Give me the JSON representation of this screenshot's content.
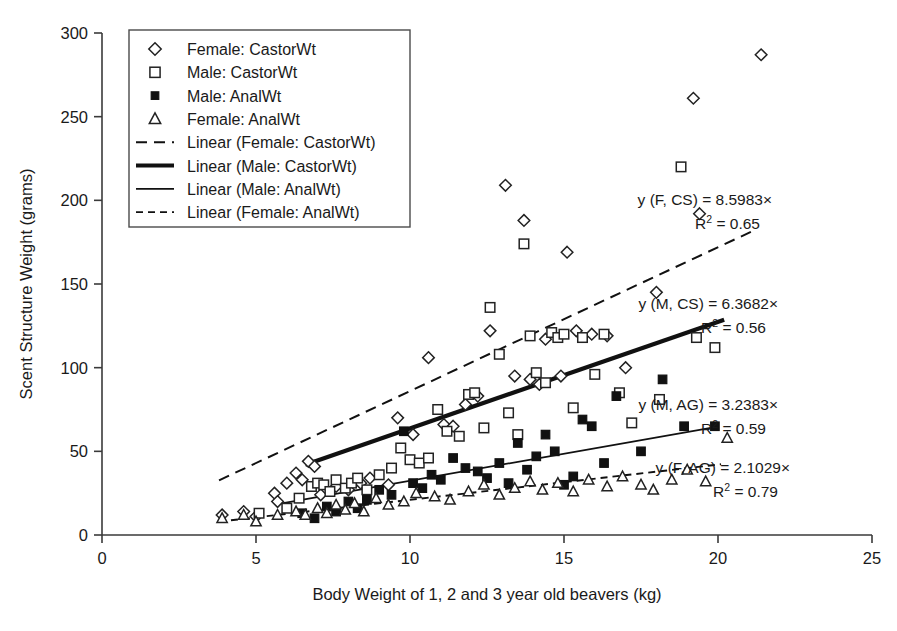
{
  "chart_data": {
    "type": "scatter",
    "title": "",
    "xlabel": "Body Weight of 1, 2 and 3 year old beavers (kg)",
    "ylabel": "Scent Structure Weight (grams)",
    "xlim": [
      0,
      25
    ],
    "ylim": [
      0,
      300
    ],
    "xticks": [
      0,
      5,
      10,
      15,
      20,
      25
    ],
    "yticks": [
      0,
      50,
      100,
      150,
      200,
      250,
      300
    ],
    "grid": false,
    "legend_position": "upper-left",
    "series": [
      {
        "name": "Female: CastorWt",
        "marker": "diamond-open",
        "points": [
          [
            3.9,
            12
          ],
          [
            4.6,
            14
          ],
          [
            5.0,
            11
          ],
          [
            5.6,
            25
          ],
          [
            5.7,
            20
          ],
          [
            6.0,
            31
          ],
          [
            6.3,
            37
          ],
          [
            6.5,
            33
          ],
          [
            6.7,
            44
          ],
          [
            6.9,
            41
          ],
          [
            7.1,
            24
          ],
          [
            7.6,
            29
          ],
          [
            8.0,
            27
          ],
          [
            8.4,
            31
          ],
          [
            8.7,
            34
          ],
          [
            9.3,
            30
          ],
          [
            9.6,
            70
          ],
          [
            10.1,
            60
          ],
          [
            10.6,
            106
          ],
          [
            11.1,
            66
          ],
          [
            11.4,
            65
          ],
          [
            11.8,
            78
          ],
          [
            12.2,
            83
          ],
          [
            12.6,
            122
          ],
          [
            13.1,
            209
          ],
          [
            13.4,
            95
          ],
          [
            13.7,
            188
          ],
          [
            13.9,
            93
          ],
          [
            14.2,
            90
          ],
          [
            14.4,
            117
          ],
          [
            14.9,
            95
          ],
          [
            15.1,
            169
          ],
          [
            15.4,
            122
          ],
          [
            15.9,
            120
          ],
          [
            16.4,
            119
          ],
          [
            17.0,
            100
          ],
          [
            18.0,
            145
          ],
          [
            19.2,
            261
          ],
          [
            19.4,
            192
          ],
          [
            21.4,
            287
          ]
        ]
      },
      {
        "name": "Male: CastorWt",
        "marker": "square-open",
        "points": [
          [
            5.1,
            13
          ],
          [
            6.0,
            16
          ],
          [
            6.4,
            22
          ],
          [
            6.8,
            29
          ],
          [
            7.0,
            31
          ],
          [
            7.2,
            30
          ],
          [
            7.4,
            26
          ],
          [
            7.6,
            33
          ],
          [
            7.9,
            28
          ],
          [
            8.1,
            31
          ],
          [
            8.3,
            34
          ],
          [
            8.6,
            27
          ],
          [
            9.0,
            36
          ],
          [
            9.4,
            40
          ],
          [
            9.7,
            52
          ],
          [
            10.0,
            45
          ],
          [
            10.3,
            43
          ],
          [
            10.6,
            46
          ],
          [
            10.9,
            75
          ],
          [
            11.2,
            62
          ],
          [
            11.6,
            59
          ],
          [
            11.9,
            84
          ],
          [
            12.1,
            85
          ],
          [
            12.4,
            64
          ],
          [
            12.6,
            136
          ],
          [
            12.9,
            108
          ],
          [
            13.2,
            73
          ],
          [
            13.5,
            60
          ],
          [
            13.7,
            174
          ],
          [
            13.9,
            119
          ],
          [
            14.1,
            97
          ],
          [
            14.4,
            91
          ],
          [
            14.6,
            121
          ],
          [
            14.8,
            118
          ],
          [
            15.0,
            120
          ],
          [
            15.3,
            76
          ],
          [
            15.6,
            118
          ],
          [
            16.0,
            96
          ],
          [
            16.3,
            120
          ],
          [
            16.8,
            85
          ],
          [
            17.2,
            67
          ],
          [
            18.1,
            81
          ],
          [
            18.8,
            220
          ],
          [
            19.3,
            118
          ],
          [
            19.9,
            112
          ]
        ]
      },
      {
        "name": "Male: AnalWt",
        "marker": "square-filled",
        "points": [
          [
            6.5,
            13
          ],
          [
            6.9,
            10
          ],
          [
            7.3,
            17
          ],
          [
            7.6,
            14
          ],
          [
            8.0,
            20
          ],
          [
            8.3,
            16
          ],
          [
            8.6,
            21
          ],
          [
            9.0,
            27
          ],
          [
            9.4,
            24
          ],
          [
            9.8,
            62
          ],
          [
            10.1,
            31
          ],
          [
            10.4,
            28
          ],
          [
            10.7,
            36
          ],
          [
            11.0,
            33
          ],
          [
            11.4,
            46
          ],
          [
            11.8,
            40
          ],
          [
            12.2,
            38
          ],
          [
            12.5,
            34
          ],
          [
            12.9,
            43
          ],
          [
            13.2,
            31
          ],
          [
            13.5,
            55
          ],
          [
            13.8,
            39
          ],
          [
            14.1,
            47
          ],
          [
            14.4,
            60
          ],
          [
            14.7,
            50
          ],
          [
            15.0,
            30
          ],
          [
            15.3,
            35
          ],
          [
            15.6,
            69
          ],
          [
            15.9,
            65
          ],
          [
            16.3,
            43
          ],
          [
            16.7,
            83
          ],
          [
            17.5,
            50
          ],
          [
            18.2,
            93
          ],
          [
            18.9,
            65
          ],
          [
            19.9,
            65
          ]
        ]
      },
      {
        "name": "Female: AnalWt",
        "marker": "triangle-open",
        "points": [
          [
            3.9,
            10
          ],
          [
            4.6,
            12
          ],
          [
            5.0,
            8
          ],
          [
            5.7,
            12
          ],
          [
            6.3,
            14
          ],
          [
            6.6,
            12
          ],
          [
            7.0,
            16
          ],
          [
            7.3,
            13
          ],
          [
            7.6,
            18
          ],
          [
            7.9,
            15
          ],
          [
            8.2,
            19
          ],
          [
            8.5,
            14
          ],
          [
            8.9,
            22
          ],
          [
            9.3,
            18
          ],
          [
            9.8,
            20
          ],
          [
            10.2,
            25
          ],
          [
            10.8,
            23
          ],
          [
            11.3,
            21
          ],
          [
            11.9,
            26
          ],
          [
            12.4,
            30
          ],
          [
            12.9,
            24
          ],
          [
            13.4,
            28
          ],
          [
            13.9,
            32
          ],
          [
            14.3,
            27
          ],
          [
            14.8,
            31
          ],
          [
            15.3,
            26
          ],
          [
            15.8,
            33
          ],
          [
            16.4,
            29
          ],
          [
            16.9,
            35
          ],
          [
            17.5,
            30
          ],
          [
            17.9,
            27
          ],
          [
            18.5,
            33
          ],
          [
            19.0,
            39
          ],
          [
            19.6,
            32
          ],
          [
            20.3,
            58
          ]
        ]
      }
    ],
    "fits": [
      {
        "name": "Linear (Female: CastorWt)",
        "slope": 8.5983,
        "intercept": 0,
        "r2": 0.65,
        "style": "dashed-thin",
        "x_start": 3.8,
        "x_end": 21.2
      },
      {
        "name": "Linear (Male: CastorWt)",
        "slope": 6.3682,
        "intercept": 0,
        "r2": 0.56,
        "style": "solid-bold",
        "x_start": 6.6,
        "x_end": 20.2
      },
      {
        "name": "Linear (Male: AnalWt)",
        "slope": 3.2383,
        "intercept": 0,
        "r2": 0.59,
        "style": "solid-thin",
        "x_start": 5.7,
        "x_end": 20.0
      },
      {
        "name": "Linear (Female: AnalWt)",
        "slope": 2.1029,
        "intercept": 0,
        "r2": 0.79,
        "style": "dashed-thin2",
        "x_start": 3.8,
        "x_end": 20.1
      }
    ],
    "annotations": [
      {
        "id": "fcs",
        "line1": "y (F, CS) = 8.5983×",
        "r2_prefix": "R",
        "r2_sup": "2",
        "r2_value": " = 0.65",
        "x_px": 772,
        "y_px": 205
      },
      {
        "id": "mcs",
        "line1": "y (M, CS) = 6.3682×",
        "r2_prefix": "R",
        "r2_sup": "2",
        "r2_value": " = 0.56",
        "x_px": 778,
        "y_px": 309
      },
      {
        "id": "mag",
        "line1": "y (M, AG) = 3.2383×",
        "r2_prefix": "R",
        "r2_sup": "2",
        "r2_value": " = 0.59",
        "x_px": 778,
        "y_px": 410
      },
      {
        "id": "fag",
        "line1": "y (F, AG) = 2.1029×",
        "r2_prefix": "R",
        "r2_sup": "2",
        "r2_value": " = 0.79",
        "x_px": 790,
        "y_px": 473
      }
    ]
  },
  "legend": {
    "items": [
      {
        "label": "Female: CastorWt",
        "marker": "diamond-open"
      },
      {
        "label": "Male: CastorWt",
        "marker": "square-open"
      },
      {
        "label": "Male: AnalWt",
        "marker": "square-filled"
      },
      {
        "label": "Female: AnalWt",
        "marker": "triangle-open"
      },
      {
        "label": "Linear (Female: CastorWt)",
        "marker": "line-dashed-thin"
      },
      {
        "label": "Linear (Male: CastorWt)",
        "marker": "line-solid-bold"
      },
      {
        "label": "Linear (Male: AnalWt)",
        "marker": "line-solid-thin"
      },
      {
        "label": "Linear (Female: AnalWt)",
        "marker": "line-dashed-thin2"
      }
    ]
  },
  "axes": {
    "x_tick_labels": [
      "0",
      "5",
      "10",
      "15",
      "20",
      "25"
    ],
    "y_tick_labels": [
      "0",
      "50",
      "100",
      "150",
      "200",
      "250",
      "300"
    ],
    "x_title": "Body Weight of 1, 2 and 3 year old beavers (kg)",
    "y_title": "Scent Structure Weight (grams)"
  },
  "colors": {
    "marker_stroke": "#222222",
    "marker_fill_open": "#ffffff",
    "marker_fill_solid": "#111111",
    "axis": "#3a3a3a",
    "text": "#1a1a1a",
    "background": "#ffffff"
  }
}
